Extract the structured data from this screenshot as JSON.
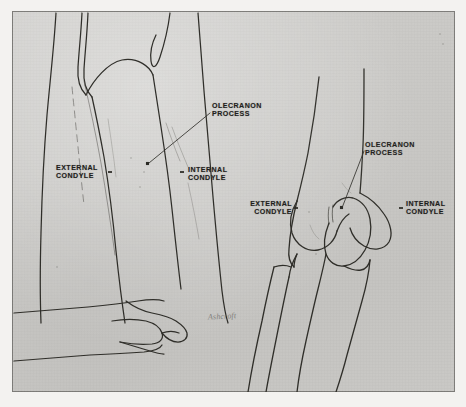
{
  "plate": {
    "kind": "anatomical-illustration",
    "subject": "Elbow — surface landmarks and bony anatomy",
    "background_color": "#c8c7c4",
    "margin_color": "#f3f2f0",
    "ink_color": "#2b2a26",
    "border_color": "#7d7c79"
  },
  "figures": {
    "left": {
      "name": "posterior-view-of-arm-with-examiner-hand",
      "description": "Posterior view of flexed elbow with examining hand below"
    },
    "right": {
      "name": "skeletal-elbow-humerus-ulna-radius",
      "description": "Line drawing of distal humerus with ulna and radius"
    }
  },
  "labels": {
    "left_olecranon": "OLECRANON\nPROCESS",
    "left_external_condyle": "EXTERNAL\nCONDYLE",
    "left_internal_condyle": "INTERNAL\nCONDYLE",
    "right_olecranon": "OLECRANON PROCESS",
    "right_external_condyle": "EXTERNAL\nCONDYLE",
    "right_internal_condyle": "INTERNAL\nCONDYLE"
  },
  "signature": {
    "text": "Ashcroft"
  }
}
